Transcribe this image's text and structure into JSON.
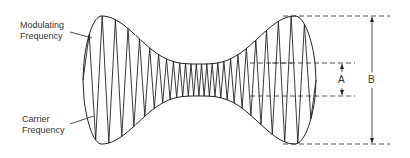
{
  "labels": {
    "modulating": [
      "Modulating",
      "Frequency"
    ],
    "carrier": [
      "Carrier",
      "Frequency"
    ],
    "a": "A",
    "b": "B"
  },
  "colors": {
    "line": "#222222",
    "background": "#ffffff"
  }
}
